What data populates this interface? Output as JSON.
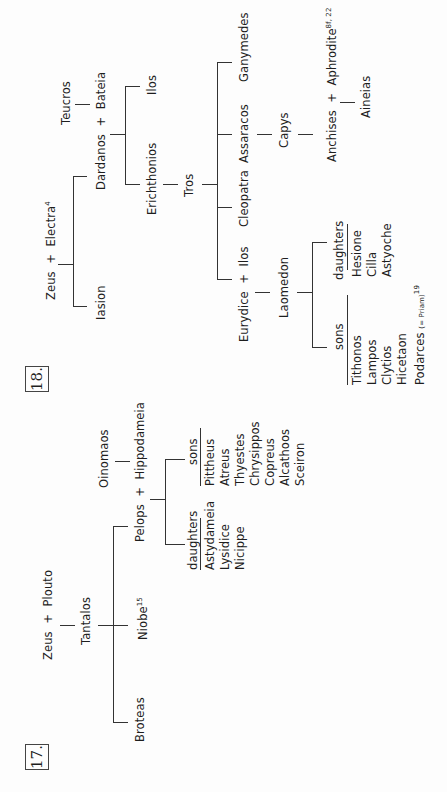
{
  "diagram_17": {
    "number": "17.",
    "root": {
      "father": "Zeus",
      "plus": "+",
      "mother": "Plouto"
    },
    "son": "Tantalos",
    "tantalos_children": [
      "Pelops",
      "Niobe",
      "Broteas"
    ],
    "niobe_note": "15",
    "pelops_union": {
      "husband": "Pelops",
      "plus": "+",
      "wife": "Hippodameia"
    },
    "wife_father": "Oinomaos",
    "daughters_label": "daughters",
    "daughters": [
      "Astydameia",
      "Lysidice",
      "Nicippe"
    ],
    "sons_label": "sons",
    "sons": [
      "Pittheus",
      "Atreus",
      "Thyestes",
      "Chrysippos",
      "Copreus",
      "Alcathoos",
      "Sceiron"
    ]
  },
  "diagram_18": {
    "number": "18.",
    "root": {
      "father": "Zeus",
      "plus": "+",
      "mother": "Electra",
      "mother_note": "4"
    },
    "zeus_children": [
      "Dardanos",
      "Iasion"
    ],
    "dardanos_union": {
      "husband": "Dardanos",
      "plus": "+",
      "wife": "Bateia"
    },
    "wife_father": "Teucros",
    "dardanos_children": [
      "Ilos",
      "Erichthonios"
    ],
    "erichthonios_son": "Tros",
    "tros_children": [
      "Ganymedes",
      "Assaracos",
      "Cleopatra",
      "Ilos"
    ],
    "ilos_union": {
      "wife": "Eurydice",
      "plus": "+",
      "husband": "Ilos"
    },
    "ilos_son": "Laomedon",
    "assaracos_son": "Capys",
    "capys_union": {
      "husband": "Anchises",
      "plus": "+",
      "wife": "Aphrodite",
      "wife_note": "8f, 22"
    },
    "anchises_son": "Aineias",
    "daughters_label": "daughters",
    "daughters": [
      "Hesione",
      "Cilla",
      "Astyoche"
    ],
    "sons_label": "sons",
    "sons": [
      "Tithonos",
      "Lampos",
      "Clytios",
      "Hicetaon",
      "Podarces"
    ],
    "podarces_note": "(= Priam)",
    "podarces_ref": "19"
  }
}
